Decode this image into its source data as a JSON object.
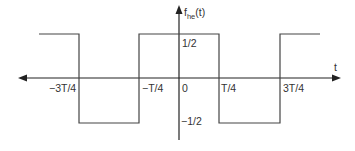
{
  "diagram": {
    "type": "square-wave",
    "function_label": {
      "base": "f",
      "subscript": "he",
      "arg": "(t)"
    },
    "x_axis_label": "t",
    "y_levels": {
      "high": "1/2",
      "low": "−1/2"
    },
    "x_ticks": [
      {
        "label": "−3T/4",
        "value": -0.75
      },
      {
        "label": "−T/4",
        "value": -0.25
      },
      {
        "label": "0",
        "value": 0
      },
      {
        "label": "T/4",
        "value": 0.25
      },
      {
        "label": "3T/4",
        "value": 0.75
      }
    ],
    "segments": [
      {
        "from": -1.05,
        "to": -0.75,
        "level": 0.5
      },
      {
        "from": -0.75,
        "to": -0.25,
        "level": -0.5
      },
      {
        "from": -0.25,
        "to": 0.25,
        "level": 0.5
      },
      {
        "from": 0.25,
        "to": 0.75,
        "level": -0.5
      },
      {
        "from": 0.75,
        "to": 1.05,
        "level": 0.5
      }
    ],
    "colors": {
      "line": "#444444",
      "axis": "#222222",
      "text": "#333333"
    }
  }
}
